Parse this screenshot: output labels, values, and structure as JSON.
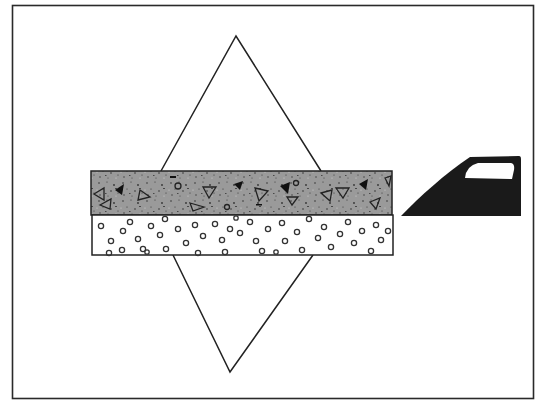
{
  "figure": {
    "description": "Schematic: a diamond (rhombus) outline crossing a two-layer horizontal slab, with a dark car-door-window silhouette to the right",
    "colors": {
      "background": "#ffffff",
      "frame": "#2a2a2a",
      "line": "#222222",
      "upper_layer_fill": "#9a9a9a",
      "speckle": "#333333",
      "lower_layer_fill": "#ffffff",
      "circle_stroke": "#333333",
      "silhouette": "#1a1a1a"
    },
    "elements": {
      "frame": "outer-border",
      "diamond": "rhombus-outline",
      "slab_upper": "speckled-gray-layer-with-triangles",
      "slab_lower": "white-layer-with-small-circles",
      "silhouette": "car-door-window-shape"
    }
  }
}
